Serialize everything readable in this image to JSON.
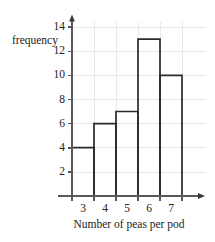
{
  "chart_data": {
    "type": "bar",
    "title": "",
    "subtitle": "",
    "xlabel": "Number of peas per pod",
    "ylabel": "frequency",
    "categories": [
      "3",
      "4",
      "5",
      "6",
      "7"
    ],
    "values": [
      4,
      6,
      7,
      13,
      10
    ],
    "x": [
      3,
      4,
      5,
      6,
      7
    ],
    "ylim": [
      0,
      14
    ],
    "xlim": [
      2.5,
      7.5
    ],
    "ytick_labels": [
      "2",
      "4",
      "6",
      "8",
      "10",
      "12",
      "14"
    ],
    "ytick_values": [
      2,
      4,
      6,
      8,
      10,
      12,
      14
    ],
    "ytick_step": 2,
    "xtick_labels": [
      "3",
      "4",
      "5",
      "6",
      "7"
    ],
    "grid": true,
    "grid_axis": "both",
    "legend": false,
    "legend_position": "none",
    "bar_style": "outline",
    "bar_fill": "#ffffff",
    "bar_stroke": "#2b2b2d",
    "grid_color": "#e2e2e2",
    "axis_color": "#58585a",
    "background": "#ffffff",
    "axes_arrows": true,
    "annotations": []
  },
  "axis_titles": {
    "y": "frequency",
    "x": "Number of peas per pod"
  }
}
